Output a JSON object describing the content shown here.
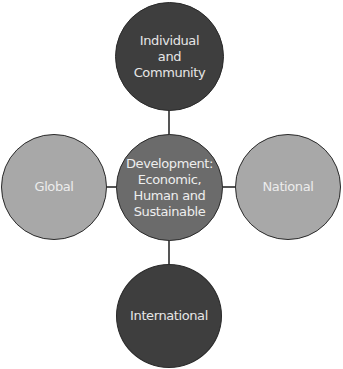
{
  "diagram": {
    "type": "hub-and-spoke",
    "center": {
      "label": "Development:\nEconomic,\nHuman and\nSustainable",
      "fill": "#6b6b6b",
      "text_color": "#eeeeee"
    },
    "nodes": [
      {
        "id": "top",
        "label": "Individual\nand\nCommunity",
        "fill": "#3e3e3e",
        "text_color": "#e6e6e6"
      },
      {
        "id": "right",
        "label": "National",
        "fill": "#a8a8a8",
        "text_color": "#ececec"
      },
      {
        "id": "bottom",
        "label": "International",
        "fill": "#3e3e3e",
        "text_color": "#e6e6e6"
      },
      {
        "id": "left",
        "label": "Global",
        "fill": "#a8a8a8",
        "text_color": "#ececec"
      }
    ],
    "connector_color": "#555555"
  }
}
